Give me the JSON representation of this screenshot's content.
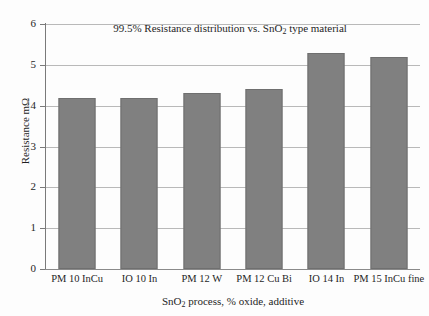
{
  "chart_data": {
    "type": "bar",
    "title": "99.5% Resistance distribution vs.  SnO2 type material",
    "title_parts": {
      "before": "99.5% Resistance distribution vs.  SnO",
      "sub": "2",
      "after": " type material"
    },
    "categories": [
      "PM 10 InCu",
      "IO 10 In",
      "PM 12 W",
      "PM 12 Cu Bi",
      "IO 14 In",
      "PM 15 InCu fine"
    ],
    "values": [
      4.2,
      4.2,
      4.3,
      4.4,
      5.3,
      5.2
    ],
    "xlabel": "SnO2  process, % oxide, additive",
    "xlabel_parts": {
      "before": "SnO",
      "sub": "2",
      "after": "  process, % oxide, additive"
    },
    "ylabel": "Resistance mΩ",
    "ylim": [
      0,
      6
    ],
    "ytick_labels": [
      "6",
      "5",
      "4",
      "3",
      "2",
      "1",
      "0"
    ],
    "ytick_values": [
      6,
      5,
      4,
      3,
      2,
      1,
      0
    ],
    "grid": true,
    "legend": "none",
    "bar_color": "#808080",
    "grid_color": "#b9b9b9",
    "axis_color": "#7a7a7a",
    "background": "#fdfdfd"
  }
}
